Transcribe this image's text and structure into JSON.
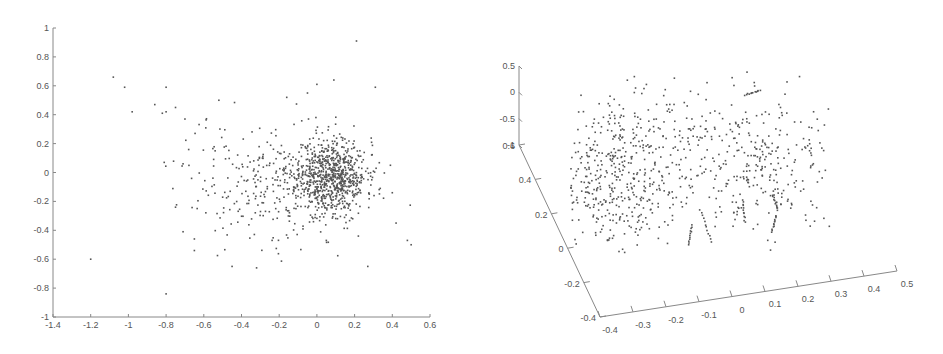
{
  "chart_data": [
    {
      "type": "scatter",
      "title": "",
      "xlabel": "",
      "ylabel": "",
      "xlim": [
        -1.4,
        0.6
      ],
      "ylim": [
        -1,
        1
      ],
      "grid": false,
      "legend": null,
      "x_ticks": [
        "-1.4",
        "-1.2",
        "-1",
        "-0.8",
        "-0.6",
        "-0.4",
        "-0.2",
        "0",
        "0.2",
        "0.4",
        "0.6"
      ],
      "x_tick_values": [
        -1.4,
        -1.2,
        -1.0,
        -0.8,
        -0.6,
        -0.4,
        -0.2,
        0,
        0.2,
        0.4,
        0.6
      ],
      "y_ticks": [
        "1",
        "0.8",
        "0.6",
        "0.4",
        "0.2",
        "0",
        "-0.2",
        "-0.4",
        "-0.6",
        "-0.8",
        "-1"
      ],
      "y_tick_values": [
        1,
        0.8,
        0.6,
        0.4,
        0.2,
        0,
        -0.2,
        -0.4,
        -0.6,
        -0.8,
        -1
      ],
      "point_color": "#555555",
      "clusters": [
        {
          "cx": 0.08,
          "cy": -0.02,
          "sx": 0.09,
          "sy": 0.13,
          "n": 700,
          "seed": 11
        },
        {
          "cx": -0.1,
          "cy": -0.08,
          "sx": 0.18,
          "sy": 0.18,
          "n": 250,
          "seed": 23
        },
        {
          "cx": -0.4,
          "cy": -0.05,
          "sx": 0.17,
          "sy": 0.22,
          "n": 120,
          "seed": 37
        }
      ],
      "outliers": [
        [
          -1.08,
          0.66
        ],
        [
          -1.02,
          0.59
        ],
        [
          -0.8,
          0.59
        ],
        [
          -0.98,
          0.42
        ],
        [
          -0.86,
          0.47
        ],
        [
          -0.82,
          0.41
        ],
        [
          -0.8,
          0.42
        ],
        [
          -0.75,
          0.45
        ],
        [
          -0.81,
          0.07
        ],
        [
          -0.75,
          -0.24
        ],
        [
          -1.2,
          -0.6
        ],
        [
          -0.8,
          -0.84
        ],
        [
          0.21,
          0.91
        ],
        [
          0.5,
          -0.5
        ],
        [
          0.48,
          -0.47
        ],
        [
          0.27,
          -0.65
        ],
        [
          0.42,
          -0.35
        ],
        [
          -0.32,
          -0.66
        ],
        [
          -0.45,
          -0.65
        ],
        [
          -0.52,
          0.5
        ],
        [
          -0.16,
          0.52
        ],
        [
          0.31,
          0.59
        ],
        [
          0.0,
          0.61
        ],
        [
          0.09,
          0.64
        ],
        [
          -0.05,
          0.55
        ],
        [
          0.39,
          0.05
        ],
        [
          0.4,
          -0.14
        ],
        [
          -0.7,
          0.37
        ],
        [
          -0.71,
          0.06
        ],
        [
          -0.65,
          -0.46
        ],
        [
          -0.65,
          -0.54
        ],
        [
          -0.71,
          -0.41
        ],
        [
          0.05,
          -0.47
        ],
        [
          0.22,
          -0.44
        ]
      ]
    },
    {
      "type": "scatter3d",
      "title": "",
      "xlabel": "",
      "ylabel": "",
      "zlabel": "",
      "xlim": [
        -0.4,
        0.5
      ],
      "ylim": [
        -0.4,
        0.6
      ],
      "zlim": [
        -1,
        0.5
      ],
      "grid": false,
      "legend": null,
      "x_ticks": [
        "-0.4",
        "-0.3",
        "-0.2",
        "-0.1",
        "0",
        "0.1",
        "0.2",
        "0.3",
        "0.4",
        "0.5"
      ],
      "y_ticks": [
        "0.6",
        "0.4",
        "0.2",
        "0",
        "-0.2",
        "-0.4"
      ],
      "z_ticks": [
        "0.5",
        "0",
        "-0.5",
        "-1"
      ],
      "point_color": "#555555",
      "screen_clusters": [
        {
          "cx": 615,
          "cy": 175,
          "sx": 30,
          "sy": 38,
          "n": 420,
          "seed": 5
        },
        {
          "cx": 665,
          "cy": 160,
          "sx": 40,
          "sy": 40,
          "n": 120,
          "seed": 9
        },
        {
          "cx": 760,
          "cy": 165,
          "sx": 40,
          "sy": 32,
          "n": 260,
          "seed": 17
        },
        {
          "cx": 730,
          "cy": 110,
          "sx": 70,
          "sy": 20,
          "n": 40,
          "seed": 29
        }
      ],
      "streaks": [
        [
          [
            689,
            245
          ],
          [
            692,
            225
          ]
        ],
        [
          [
            700,
            210
          ],
          [
            712,
            242
          ]
        ],
        [
          [
            743,
            200
          ],
          [
            745,
            222
          ]
        ],
        [
          [
            772,
            232
          ],
          [
            776,
            216
          ]
        ],
        [
          [
            773,
            195
          ],
          [
            778,
            210
          ]
        ],
        [
          [
            745,
            95
          ],
          [
            760,
            90
          ]
        ]
      ]
    }
  ]
}
